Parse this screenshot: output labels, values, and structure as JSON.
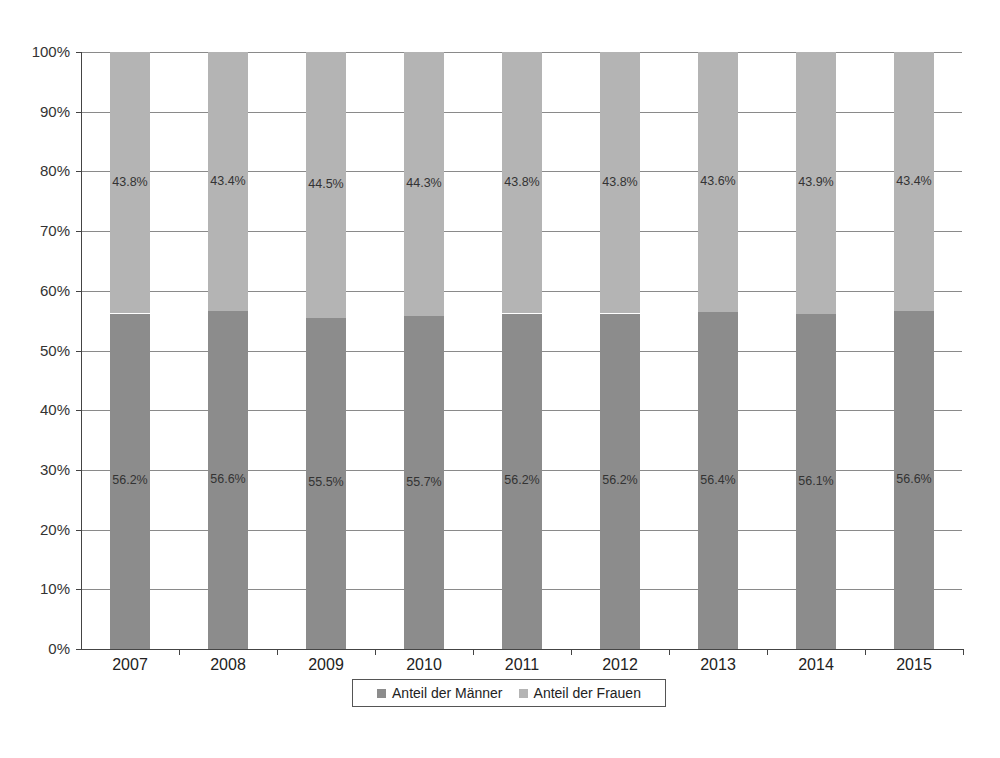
{
  "chart_data": {
    "type": "bar",
    "stacked": true,
    "percent_stacked": true,
    "title": "",
    "xlabel": "",
    "ylabel": "",
    "ylim": [
      0,
      100
    ],
    "y_ticks": [
      "0%",
      "10%",
      "20%",
      "30%",
      "40%",
      "50%",
      "60%",
      "70%",
      "80%",
      "90%",
      "100%"
    ],
    "grid": true,
    "legend_position": "bottom",
    "categories": [
      "2007",
      "2008",
      "2009",
      "2010",
      "2011",
      "2012",
      "2013",
      "2014",
      "2015"
    ],
    "series": [
      {
        "name": "Anteil der Männer",
        "color": "#8c8c8c",
        "values": [
          56.2,
          56.6,
          55.5,
          55.7,
          56.2,
          56.2,
          56.4,
          56.1,
          56.6
        ],
        "labels": [
          "56.2%",
          "56.6%",
          "55.5%",
          "55.7%",
          "56.2%",
          "56.2%",
          "56.4%",
          "56.1%",
          "56.6%"
        ]
      },
      {
        "name": "Anteil der Frauen",
        "color": "#b4b4b4",
        "values": [
          43.8,
          43.4,
          44.5,
          44.3,
          43.8,
          43.8,
          43.6,
          43.9,
          43.4
        ],
        "labels": [
          "43.8%",
          "43.4%",
          "44.5%",
          "44.3%",
          "43.8%",
          "43.8%",
          "43.6%",
          "43.9%",
          "43.4%"
        ]
      }
    ]
  },
  "legend": {
    "items": [
      {
        "label": "Anteil der Männer",
        "color": "#8c8c8c"
      },
      {
        "label": "Anteil der Frauen",
        "color": "#b4b4b4"
      }
    ]
  }
}
